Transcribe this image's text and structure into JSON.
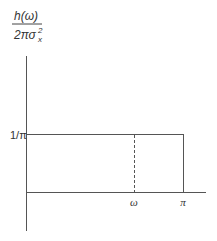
{
  "diagram": {
    "y_label": {
      "numerator": "h(ω)",
      "denominator": "2πσ",
      "sigma_sup": "2",
      "sigma_sub": "x"
    },
    "y_tick": "1/π",
    "x_ticks": [
      "ω",
      "π"
    ],
    "colors": {
      "axis": "#555555",
      "curve": "#555555"
    }
  }
}
